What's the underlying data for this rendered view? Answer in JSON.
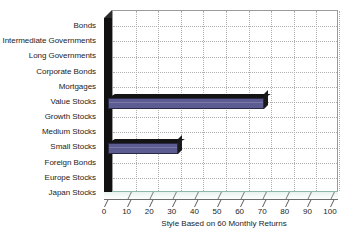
{
  "chart_data": {
    "type": "bar",
    "orientation": "horizontal",
    "title": "",
    "xlabel": "Style Based on 60 Monthly Returns",
    "ylabel": "",
    "xlim": [
      0,
      100
    ],
    "xticks": [
      0,
      10,
      20,
      30,
      40,
      50,
      60,
      70,
      80,
      90,
      100
    ],
    "xtick_labels": [
      "0",
      "10",
      "20",
      "30",
      "40",
      "50",
      "60",
      "70",
      "80",
      "90",
      "100"
    ],
    "grid": true,
    "legend": false,
    "bar_color": "#5c5c92",
    "categories": [
      "Bonds",
      "Intermediate Governments",
      "Long Governments",
      "Corporate Bonds",
      "Mortgages",
      "Value Stocks",
      "Growth Stocks",
      "Medium Stocks",
      "Small Stocks",
      "Foreign Bonds",
      "Europe Stocks",
      "Japan Stocks"
    ],
    "values": [
      0,
      0,
      0,
      0,
      0,
      69,
      0,
      0,
      31,
      0,
      0,
      0
    ]
  }
}
